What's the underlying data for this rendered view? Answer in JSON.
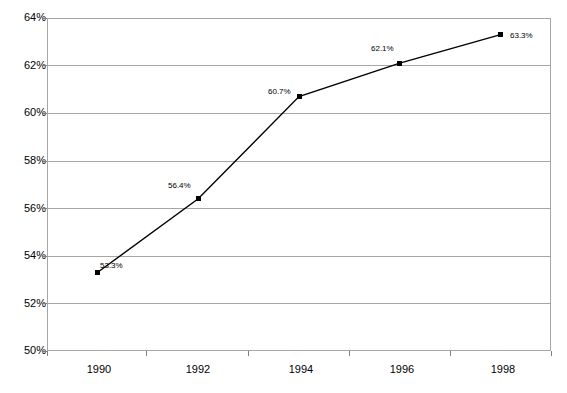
{
  "chart_data": {
    "type": "line",
    "title": "",
    "subtitle": "",
    "xlabel": "",
    "ylabel": "",
    "categories": [
      "1990",
      "1992",
      "1994",
      "1996",
      "1998"
    ],
    "values": [
      53.3,
      56.4,
      60.7,
      62.1,
      63.3
    ],
    "point_labels": [
      "53.3%",
      "56.4%",
      "60.7%",
      "62.1%",
      "63.3%"
    ],
    "series": [
      {
        "name": "",
        "values": [
          53.3,
          56.4,
          60.7,
          62.1,
          63.3
        ]
      }
    ],
    "ylim": [
      50,
      64
    ],
    "ytick_values": [
      50,
      52,
      54,
      56,
      58,
      60,
      62,
      64
    ],
    "ytick_labels": [
      "50%",
      "52%",
      "54%",
      "56%",
      "58%",
      "60%",
      "62%",
      "64%"
    ],
    "xtick_labels": [
      "1990",
      "1992",
      "1994",
      "1996",
      "1998"
    ],
    "grid": "horizontal",
    "legend": "none",
    "marker": "square",
    "line_color": "#000000",
    "marker_color": "#000000",
    "grid_color": "#a6a6a6",
    "axis_color": "#7f7f7f",
    "background_color": "#ffffff",
    "label_positions": [
      "above-left",
      "above-left",
      "above-left",
      "above-left",
      "right"
    ]
  }
}
